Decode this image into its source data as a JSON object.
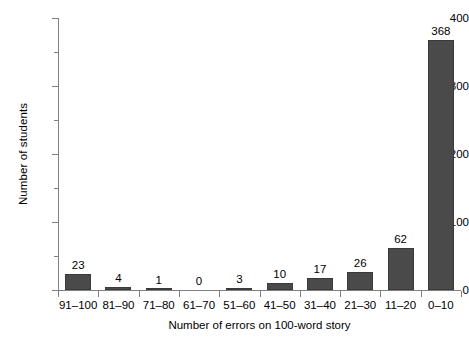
{
  "chart_data": {
    "type": "bar",
    "title": "",
    "subtitle": "",
    "xlabel": "Number of errors on 100-word story",
    "ylabel": "Number of students",
    "categories": [
      "91–100",
      "81–90",
      "71–80",
      "61–70",
      "51–60",
      "41–50",
      "31–40",
      "21–30",
      "11–20",
      "0–10"
    ],
    "values": [
      23,
      4,
      1,
      0,
      3,
      10,
      17,
      26,
      62,
      368
    ],
    "data_labels": [
      "23",
      "4",
      "1",
      "0",
      "3",
      "10",
      "17",
      "26",
      "62",
      "368"
    ],
    "ylim": [
      0,
      400
    ],
    "y_major_ticks": [
      0,
      100,
      200,
      300,
      400
    ],
    "y_major_tick_labels": [
      "0",
      "100",
      "200",
      "300",
      "400"
    ],
    "y_minor_ticks": [
      50,
      150,
      250,
      350
    ],
    "grid": false,
    "legend": false,
    "legend_position": "none",
    "bar_color": "#4a4a4a",
    "bar_edge_color": "#3a3a3a",
    "axis_color": "#808080",
    "background_color": "#ffffff",
    "text_color": "#000000"
  }
}
